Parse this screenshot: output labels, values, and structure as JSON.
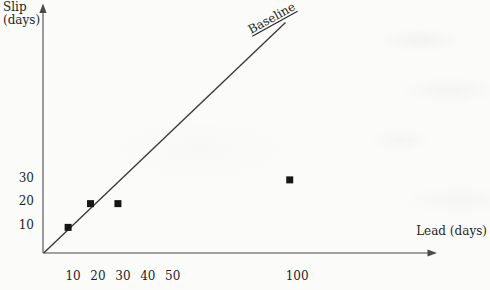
{
  "chart_data": {
    "type": "scatter",
    "title": "",
    "xlabel": "Lead (days)",
    "ylabel_lines": [
      "Slip",
      "(days)"
    ],
    "x_ticks": [
      10,
      20,
      30,
      40,
      50,
      100
    ],
    "y_ticks": [
      10,
      20,
      30
    ],
    "xlim": [
      0,
      155
    ],
    "ylim": [
      0,
      100
    ],
    "grid": false,
    "legend": "none",
    "marker": "filled-square",
    "points": [
      {
        "lead": 8,
        "slip": 9
      },
      {
        "lead": 17,
        "slip": 19
      },
      {
        "lead": 28,
        "slip": 19
      },
      {
        "lead": 97,
        "slip": 29
      }
    ],
    "baseline": {
      "label": "Baseline",
      "relation": "slip = lead",
      "from": -1.8,
      "to": 95.3
    },
    "colors": {
      "ink": "#1f1f1f",
      "axis": "#4a4a4a",
      "line": "#3b3b3b",
      "marker": "#161616",
      "background": "#fbfbf9"
    }
  }
}
